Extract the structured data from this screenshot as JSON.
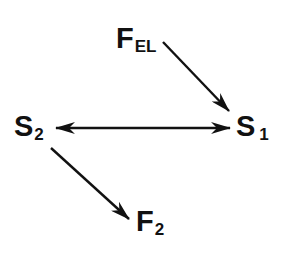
{
  "diagram": {
    "nodes": [
      {
        "id": "F_EL",
        "main": "F",
        "sub": "EL",
        "x": 116,
        "y": 24
      },
      {
        "id": "S_2",
        "main": "S",
        "sub": "2",
        "x": 14,
        "y": 112
      },
      {
        "id": "S_1",
        "main": "S",
        "sub": "1",
        "x": 236,
        "y": 112
      },
      {
        "id": "F_2",
        "main": "F",
        "sub": "2",
        "x": 136,
        "y": 207
      }
    ],
    "edges": [
      {
        "from": "F_EL",
        "to": "S_1",
        "type": "directed"
      },
      {
        "from": "S_2",
        "to": "S_1",
        "type": "bidirectional"
      },
      {
        "from": "S_2",
        "to": "F_2",
        "type": "directed"
      }
    ],
    "colors": {
      "ink": "#111111",
      "background": "#ffffff"
    }
  }
}
